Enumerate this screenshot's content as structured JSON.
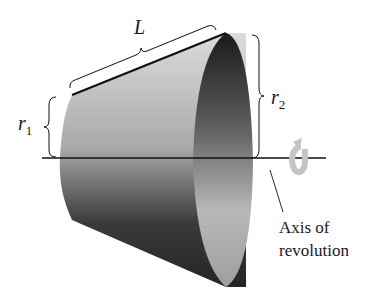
{
  "figure": {
    "labels": {
      "slant_length": "L",
      "radius1_var": "r",
      "radius1_sub": "1",
      "radius2_var": "r",
      "radius2_sub": "2",
      "axis_line1": "Axis of",
      "axis_line2": "revolution"
    },
    "icons": {
      "rotation": "rotation-arrow-icon"
    },
    "colors": {
      "surface_light": "#c8c8c8",
      "surface_dark": "#2a2a2a",
      "interior_dark": "#1e1e1e",
      "interior_light": "#bdbdbd",
      "line": "#111111",
      "arrow": "#c4c4c4"
    }
  }
}
